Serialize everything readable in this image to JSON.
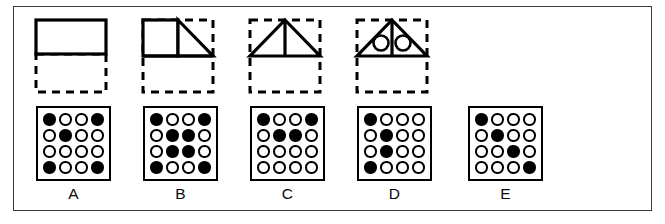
{
  "figure": {
    "title": "",
    "border_color": "#333a40",
    "ink_color": "#000000",
    "background": "#ffffff"
  },
  "options": [
    {
      "label": "A",
      "shape": {
        "name": "rectangle-over-dashed-box",
        "description": "solid rectangle occupying the upper half of a dashed square outline",
        "has_top_shape": true,
        "solid_parts": [
          "rectangle"
        ],
        "dashed_box": true,
        "inner_lines": 0,
        "inner_circles": 0
      },
      "grid": {
        "rows": 4,
        "cols": 4,
        "filled": [
          [
            1,
            0,
            0,
            1
          ],
          [
            0,
            1,
            0,
            0
          ],
          [
            0,
            0,
            0,
            0
          ],
          [
            1,
            0,
            0,
            1
          ]
        ],
        "filled_count": 5
      }
    },
    {
      "label": "B",
      "shape": {
        "name": "square-and-triangle-over-dashed-box",
        "description": "solid square beside a right triangle, filling the upper half of a dashed square outline",
        "has_top_shape": true,
        "solid_parts": [
          "square",
          "right-triangle"
        ],
        "dashed_box": true,
        "inner_lines": 1,
        "inner_circles": 0
      },
      "grid": {
        "rows": 4,
        "cols": 4,
        "filled": [
          [
            1,
            0,
            0,
            1
          ],
          [
            0,
            1,
            1,
            0
          ],
          [
            0,
            1,
            1,
            0
          ],
          [
            1,
            0,
            0,
            1
          ]
        ],
        "filled_count": 8
      }
    },
    {
      "label": "C",
      "shape": {
        "name": "triangle-with-median-over-dashed-box",
        "description": "solid triangle with a vertical centre line in the upper half of a dashed square outline",
        "has_top_shape": true,
        "solid_parts": [
          "triangle"
        ],
        "dashed_box": true,
        "inner_lines": 1,
        "inner_circles": 0
      },
      "grid": {
        "rows": 4,
        "cols": 4,
        "filled": [
          [
            1,
            0,
            0,
            1
          ],
          [
            0,
            1,
            1,
            0
          ],
          [
            0,
            0,
            0,
            0
          ],
          [
            0,
            0,
            0,
            0
          ]
        ],
        "filled_count": 4
      }
    },
    {
      "label": "D",
      "shape": {
        "name": "triangle-with-median-and-two-circles-over-dashed-box",
        "description": "solid triangle with a vertical centre line and two open circles, in the upper half of a dashed square outline",
        "has_top_shape": true,
        "solid_parts": [
          "triangle"
        ],
        "dashed_box": true,
        "inner_lines": 1,
        "inner_circles": 2
      },
      "grid": {
        "rows": 4,
        "cols": 4,
        "filled": [
          [
            1,
            0,
            0,
            0
          ],
          [
            0,
            1,
            0,
            0
          ],
          [
            0,
            1,
            0,
            0
          ],
          [
            1,
            0,
            0,
            0
          ]
        ],
        "filled_count": 4
      }
    },
    {
      "label": "E",
      "shape": {
        "name": "empty-slot",
        "description": "no figure drawn above this option",
        "has_top_shape": false,
        "solid_parts": [],
        "dashed_box": false,
        "inner_lines": 0,
        "inner_circles": 0
      },
      "grid": {
        "rows": 4,
        "cols": 4,
        "filled": [
          [
            1,
            0,
            0,
            0
          ],
          [
            0,
            1,
            0,
            0
          ],
          [
            0,
            0,
            1,
            0
          ],
          [
            0,
            0,
            0,
            1
          ]
        ],
        "filled_count": 4
      }
    }
  ]
}
